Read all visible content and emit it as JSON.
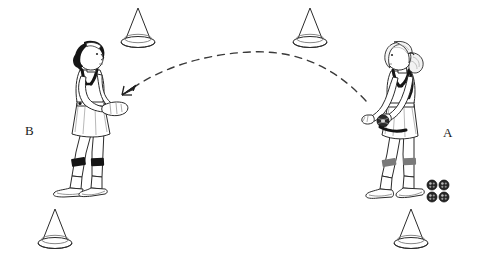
{
  "diagram": {
    "background_color": "#ffffff",
    "line_color": "#1a1a1a",
    "width": 479,
    "height": 271
  },
  "labels": [
    {
      "id": "B",
      "text": "B",
      "x": 30,
      "y": 130,
      "role": "receiver"
    },
    {
      "id": "A",
      "text": "A",
      "x": 448,
      "y": 132,
      "role": "tosser"
    }
  ],
  "players": [
    {
      "id": "player-b",
      "label": "B",
      "facing": "right",
      "hair": "dark",
      "hair_color": "#151515",
      "headband_color": "#ffffff",
      "uniform": "white tank top and skirt",
      "trim_color": "#151515",
      "knee_band_color": "#151515",
      "action": "ready to receive, hands together in front",
      "center_x": 90,
      "center_y": 120
    },
    {
      "id": "player-a",
      "label": "A",
      "facing": "left",
      "hair": "light with ponytail",
      "hair_color": "#f2f2f2",
      "headband_color": "#ffffff",
      "uniform": "white tank top and skirt",
      "trim_color": "#151515",
      "knee_band_color": "#6e6e6e",
      "action": "holding ball at waist, preparing to toss",
      "center_x": 398,
      "center_y": 120
    }
  ],
  "cones": [
    {
      "id": "cone-top-left",
      "x": 138,
      "y": 30
    },
    {
      "id": "cone-top-right",
      "x": 310,
      "y": 30
    },
    {
      "id": "cone-bottom-left",
      "x": 55,
      "y": 231
    },
    {
      "id": "cone-bottom-right",
      "x": 411,
      "y": 231
    }
  ],
  "balls": {
    "held_ball": {
      "id": "ball-in-hands",
      "x": 383,
      "y": 121,
      "radius": 6
    },
    "ball_pile": {
      "id": "ball-supply",
      "count": 4,
      "arrangement": "2x2",
      "x": 438,
      "y": 191,
      "ball_radius": 5,
      "color": "#2a2a2a"
    }
  },
  "trajectory": {
    "id": "toss-arc",
    "style": "dashed",
    "direction": "from A to B",
    "start_x": 366,
    "start_y": 101,
    "peak_x": 250,
    "peak_y": 52,
    "end_x": 126,
    "end_y": 92,
    "arrowhead": "pointing down-left toward player B",
    "dash_pattern": "7 6"
  }
}
